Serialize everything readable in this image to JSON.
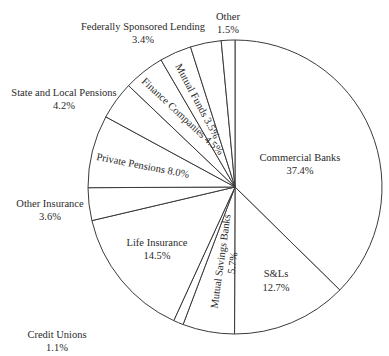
{
  "chart_data": {
    "type": "pie",
    "title": "",
    "start_angle": "12 o'clock",
    "direction": "clockwise",
    "categories": [
      "Commercial Banks",
      "S&Ls",
      "Mutual Savings Banks",
      "Credit Unions",
      "Life Insurance",
      "Other Insurance",
      "Private Pensions",
      "State and Local Pensions",
      "Finance Companies",
      "Mutual Funds",
      "Federally Sponsored Lending",
      "Other"
    ],
    "values": [
      37.4,
      12.7,
      5.7,
      1.1,
      14.5,
      3.6,
      8.0,
      4.2,
      4.5,
      3.5,
      3.4,
      1.5
    ],
    "value_labels": [
      "37.4%",
      "12.7%",
      "5.7%",
      "1.1%",
      "14.5%",
      "3.6%",
      "8.0%",
      "4.2%",
      "4.5%",
      "3.5%",
      "3.4%",
      "1.5%"
    ],
    "legend": "none (labels placed on or beside slices)",
    "fill": "#ffffff",
    "stroke": "#3a3a3a"
  },
  "labels": {
    "commercial_banks": {
      "name": "Commercial Banks",
      "value": "37.4%"
    },
    "sls": {
      "name": "S&Ls",
      "value": "12.7%"
    },
    "mutual_savings": {
      "name": "Mutual Savings Banks",
      "value": "5.7%"
    },
    "credit_unions": {
      "name": "Credit Unions",
      "value": "1.1%"
    },
    "life_insurance": {
      "name": "Life Insurance",
      "value": "14.5%"
    },
    "other_insurance": {
      "name": "Other Insurance",
      "value": "3.6%"
    },
    "private_pensions": {
      "text": "Private Pensions 8.0%"
    },
    "state_local": {
      "name": "State and Local Pensions",
      "value": "4.2%"
    },
    "finance_companies": {
      "text": "Finance Companies 4.5%"
    },
    "mutual_funds": {
      "text": "Mutual Funds 3.5%"
    },
    "federal": {
      "name": "Federally Sponsored Lending",
      "value": "3.4%"
    },
    "other": {
      "name": "Other",
      "value": "1.5%"
    }
  }
}
